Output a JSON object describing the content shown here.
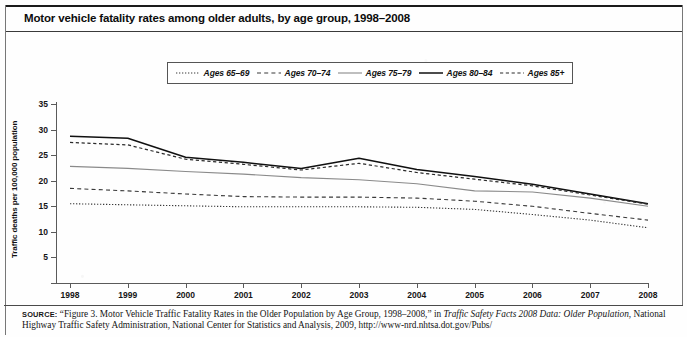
{
  "title": "Motor vehicle fatality rates among older adults, by age group, 1998–2008",
  "axes": {
    "ylabel": "Traffic deaths per 100,000 population",
    "yticks": [
      "0",
      "5",
      "10",
      "15",
      "20",
      "25",
      "30",
      "35"
    ],
    "xticks": [
      "1998",
      "1999",
      "2000",
      "2001",
      "2002",
      "2003",
      "2004",
      "2005",
      "2006",
      "2007",
      "2008"
    ]
  },
  "legend": {
    "entries": [
      {
        "label": "Ages 65–69",
        "style": "dotted"
      },
      {
        "label": "Ages 70–74",
        "style": "dashed-long"
      },
      {
        "label": "Ages 75–79",
        "style": "solid-light"
      },
      {
        "label": "Ages 80–84",
        "style": "solid-dark"
      },
      {
        "label": "Ages 85+",
        "style": "dashed-short"
      }
    ]
  },
  "source": {
    "kicker": "SOURCE:",
    "text_1": "“Figure 3. Motor Vehicle Traffic Fatality Rates in the Older Population by Age Group, 1998–2008,” in ",
    "italic_1": "Traffic Safety Facts 2008 Data: Older Population",
    "text_2": ", National Highway Traffic Safety Administration, National Center for Statistics and Analysis, 2009, http://www-nrd.nhtsa.dot.gov/Pubs/"
  },
  "chart_data": {
    "type": "line",
    "title": "Motor vehicle fatality rates among older adults, by age group, 1998–2008",
    "xlabel": "",
    "ylabel": "Traffic deaths per 100,000 population",
    "x": [
      1998,
      1999,
      2000,
      2001,
      2002,
      2003,
      2004,
      2005,
      2006,
      2007,
      2008
    ],
    "xlim": [
      1998,
      2008
    ],
    "ylim": [
      0,
      35
    ],
    "grid": false,
    "legend_position": "top-center",
    "series": [
      {
        "name": "Ages 65–69",
        "style": "dotted",
        "values": [
          15.5,
          15.3,
          15.1,
          14.9,
          14.9,
          14.9,
          14.8,
          14.4,
          13.4,
          12.3,
          10.8
        ]
      },
      {
        "name": "Ages 70–74",
        "style": "dashed-long",
        "values": [
          18.5,
          18.0,
          17.4,
          16.9,
          16.8,
          16.8,
          16.6,
          16.0,
          15.0,
          13.6,
          12.3
        ]
      },
      {
        "name": "Ages 75–79",
        "style": "solid-light",
        "values": [
          22.8,
          22.4,
          21.8,
          21.3,
          20.6,
          20.2,
          19.4,
          18.0,
          17.8,
          16.6,
          15.0
        ]
      },
      {
        "name": "Ages 80–84",
        "style": "solid-dark",
        "values": [
          28.7,
          28.3,
          24.6,
          23.6,
          22.4,
          24.4,
          22.2,
          20.8,
          19.3,
          17.4,
          15.5
        ]
      },
      {
        "name": "Ages 85+",
        "style": "dashed-short",
        "values": [
          27.5,
          27.0,
          24.2,
          23.2,
          22.1,
          23.4,
          21.6,
          20.3,
          19.0,
          17.2,
          15.4
        ]
      }
    ]
  }
}
